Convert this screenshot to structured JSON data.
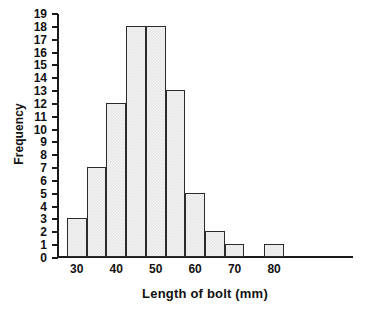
{
  "chart_data": {
    "type": "bar",
    "title": "",
    "xlabel": "Length of bolt (mm)",
    "ylabel": "Frequency",
    "categories": [
      "30-35",
      "35-40",
      "40-45",
      "45-50",
      "50-55",
      "55-60",
      "60-65",
      "65-70",
      "70-75",
      "75-80",
      "80-85"
    ],
    "bin_starts": [
      30,
      35,
      40,
      45,
      50,
      55,
      60,
      65,
      70,
      75,
      80
    ],
    "bin_width": 5,
    "values": [
      3,
      7,
      12,
      18,
      18,
      13,
      5,
      2,
      1,
      0,
      1
    ],
    "xlim": [
      27.5,
      102.5
    ],
    "ylim": [
      0,
      19
    ],
    "x_ticks": [
      30,
      40,
      50,
      60,
      70,
      80
    ],
    "x_tick_labels": [
      "30",
      "40",
      "50",
      "60",
      "70",
      "80"
    ],
    "y_ticks": [
      0,
      1,
      2,
      3,
      4,
      5,
      6,
      7,
      8,
      9,
      10,
      11,
      12,
      13,
      14,
      15,
      16,
      17,
      18,
      19
    ],
    "y_tick_labels": [
      "0",
      "1",
      "2",
      "3",
      "4",
      "5",
      "6",
      "7",
      "8",
      "9",
      "10",
      "11",
      "12",
      "13",
      "14",
      "15",
      "16",
      "17",
      "18",
      "19"
    ],
    "grid": false,
    "legend": null,
    "colors": {
      "bar_fill": "#e7e7e7",
      "bar_border": "#2b2b2b",
      "axis": "#1a1a1a",
      "text": "#111111",
      "background": "#ffffff"
    }
  }
}
